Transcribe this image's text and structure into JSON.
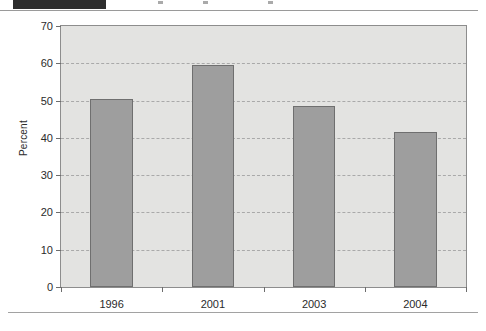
{
  "page": {
    "header_bar_label": "scanned-header-black-bar",
    "footer_rule_label": "page-footer-rule"
  },
  "chart_data": {
    "type": "bar",
    "title": "",
    "subtitle": "",
    "xlabel": "",
    "ylabel": "Percent",
    "categories": [
      "1996",
      "2001",
      "2003",
      "2004"
    ],
    "values": [
      50.5,
      59.5,
      48.5,
      41.5
    ],
    "series": [
      {
        "name": "Percent",
        "values": [
          50.5,
          59.5,
          48.5,
          41.5
        ]
      }
    ],
    "ylim": [
      0,
      70
    ],
    "ytick_values": [
      0,
      10,
      20,
      30,
      40,
      50,
      60,
      70
    ],
    "ytick_labels": [
      "0",
      "10",
      "20",
      "30",
      "40",
      "50",
      "60",
      "70"
    ],
    "grid": "horizontal-dashed",
    "legend": "none",
    "bar_color": "#9e9e9e",
    "bar_border_color": "#6f6f6f",
    "plot_background": "#e3e3e1",
    "gridline_color": "#a9a9a9",
    "annotations": []
  }
}
